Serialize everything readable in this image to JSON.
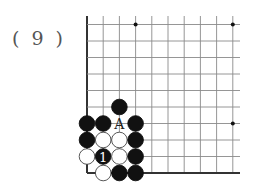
{
  "problem_label": "( 9 )",
  "board": {
    "visible_corner": "bottom-left",
    "columns_visible": 10,
    "rows_visible": 10,
    "line_color": "#8a8a8a",
    "edge_color": "#333333",
    "star_points": [
      {
        "col": 3,
        "row": 9
      },
      {
        "col": 9,
        "row": 9
      },
      {
        "col": 9,
        "row": 3
      }
    ],
    "stones": [
      {
        "col": 2,
        "row": 4,
        "color": "black"
      },
      {
        "col": 0,
        "row": 3,
        "color": "black"
      },
      {
        "col": 1,
        "row": 3,
        "color": "black"
      },
      {
        "col": 3,
        "row": 3,
        "color": "black"
      },
      {
        "col": 0,
        "row": 2,
        "color": "black"
      },
      {
        "col": 1,
        "row": 2,
        "color": "white"
      },
      {
        "col": 2,
        "row": 2,
        "color": "white"
      },
      {
        "col": 3,
        "row": 2,
        "color": "black"
      },
      {
        "col": 0,
        "row": 1,
        "color": "white"
      },
      {
        "col": 1,
        "row": 1,
        "color": "black",
        "label": "1"
      },
      {
        "col": 2,
        "row": 1,
        "color": "white"
      },
      {
        "col": 3,
        "row": 1,
        "color": "black"
      },
      {
        "col": 1,
        "row": 0,
        "color": "white"
      },
      {
        "col": 2,
        "row": 0,
        "color": "black"
      },
      {
        "col": 3,
        "row": 0,
        "color": "black"
      }
    ],
    "point_labels": [
      {
        "col": 2,
        "row": 3,
        "text": "A"
      }
    ]
  }
}
